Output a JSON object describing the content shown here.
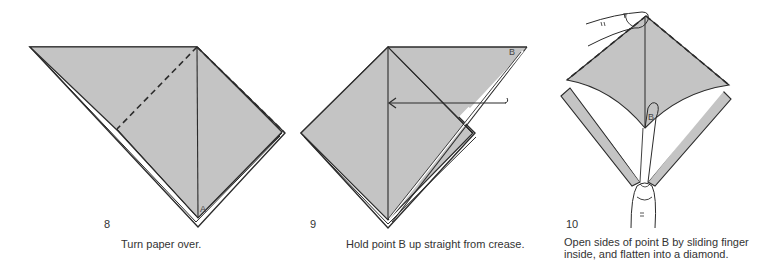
{
  "colors": {
    "paper_fill": "#c4c4c4",
    "stroke": "#2b2b2b",
    "background": "#ffffff"
  },
  "steps": [
    {
      "number": "8",
      "caption": "Turn paper over.",
      "point_labels": [
        "A"
      ]
    },
    {
      "number": "9",
      "caption": "Hold point B up straight from crease.",
      "point_labels": [
        "B"
      ]
    },
    {
      "number": "10",
      "caption_lines": [
        "Open sides of point B by sliding finger",
        "inside, and flatten into a diamond."
      ],
      "point_labels": [
        "B"
      ]
    }
  ]
}
